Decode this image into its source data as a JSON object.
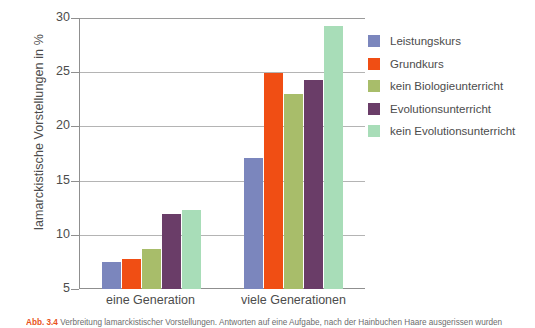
{
  "chart_data": {
    "type": "bar",
    "title": "",
    "xlabel": "",
    "ylabel": "lamarckistische Vorstellungen in %",
    "ylim": [
      5,
      30
    ],
    "yticks": [
      5,
      10,
      15,
      20,
      25,
      30
    ],
    "ytick_labels": [
      "5",
      "10",
      "15",
      "20",
      "25",
      "30"
    ],
    "grid": true,
    "legend_position": "right",
    "categories": [
      "eine Generation",
      "viele Generationen"
    ],
    "series": [
      {
        "name": "Leistungskurs",
        "color": "#7b86bd",
        "values": [
          7.5,
          17.1
        ]
      },
      {
        "name": "Grundkurs",
        "color": "#f04e14",
        "values": [
          7.8,
          24.9
        ]
      },
      {
        "name": "kein Biologieunterricht",
        "color": "#a8bd6a",
        "values": [
          8.7,
          23.0
        ]
      },
      {
        "name": "Evolutionsunterricht",
        "color": "#6a3d68",
        "values": [
          11.9,
          24.3
        ]
      },
      {
        "name": "kein Evolutionsunterricht",
        "color": "#a8ddb8",
        "values": [
          12.3,
          29.3
        ]
      }
    ]
  },
  "caption": {
    "number": "Abb. 3.4",
    "text": "Verbreitung lamarckistischer Vorstellungen. Antworten auf eine Aufgabe, nach der Hainbuchen Haare ausgerissen wurden"
  }
}
